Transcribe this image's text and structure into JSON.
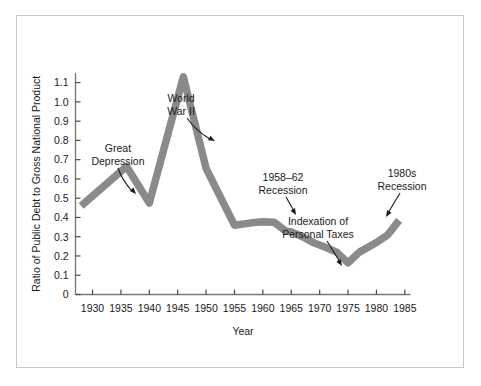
{
  "chart_data": {
    "type": "line",
    "title": "",
    "xlabel": "Year",
    "ylabel": "Ratio of Public Debt to Gross National Product",
    "xlim": [
      1927,
      1986
    ],
    "ylim": [
      0,
      1.15
    ],
    "xticks": [
      1930,
      1935,
      1940,
      1945,
      1950,
      1955,
      1960,
      1965,
      1970,
      1975,
      1980,
      1985
    ],
    "xtick_labels": [
      "1930",
      "1935",
      "1940",
      "1945",
      "1950",
      "1955",
      "1960",
      "1965",
      "1970",
      "1975",
      "1980",
      "1985"
    ],
    "yticks": [
      0,
      0.1,
      0.2,
      0.3,
      0.4,
      0.5,
      0.6,
      0.7,
      0.8,
      0.9,
      1.0,
      1.1
    ],
    "ytick_labels": [
      "0",
      "0.1",
      "0.2",
      "0.3",
      "0.4",
      "0.5",
      "0.6",
      "0.7",
      "0.8",
      "0.9",
      "1.0",
      "1.1"
    ],
    "grid": false,
    "legend": false,
    "line_color": "#8a8a8a",
    "series": [
      {
        "name": "Ratio of Public Debt to GNP",
        "x": [
          1928,
          1936,
          1940,
          1946,
          1950,
          1955,
          1958,
          1960,
          1962,
          1964,
          1965,
          1967,
          1969,
          1971,
          1973,
          1975,
          1977,
          1980,
          1982,
          1984
        ],
        "values": [
          0.46,
          0.665,
          0.475,
          1.13,
          0.655,
          0.36,
          0.372,
          0.378,
          0.375,
          0.33,
          0.325,
          0.3,
          0.268,
          0.245,
          0.22,
          0.165,
          0.22,
          0.27,
          0.31,
          0.385
        ]
      }
    ],
    "annotations": [
      {
        "id": "great-depression",
        "text_lines": [
          "Great",
          "Depression"
        ],
        "target_year": 1933,
        "target_value": 0.57
      },
      {
        "id": "world-war-ii",
        "text_lines": [
          "World",
          "War II"
        ],
        "target_year": 1944,
        "target_value": 0.81
      },
      {
        "id": "recession-1958-62",
        "text_lines": [
          "1958–62",
          "Recession"
        ],
        "target_year": 1960,
        "target_value": 0.38
      },
      {
        "id": "indexation-personal-taxes",
        "text_lines": [
          "Indexation of",
          "Personal Taxes"
        ],
        "target_year": 1975,
        "target_value": 0.165
      },
      {
        "id": "recession-1980s",
        "text_lines": [
          "1980s",
          "Recession"
        ],
        "target_year": 1983,
        "target_value": 0.345
      }
    ]
  },
  "figure": {
    "border_color": "#c8c8c8",
    "background": "#ffffff"
  }
}
